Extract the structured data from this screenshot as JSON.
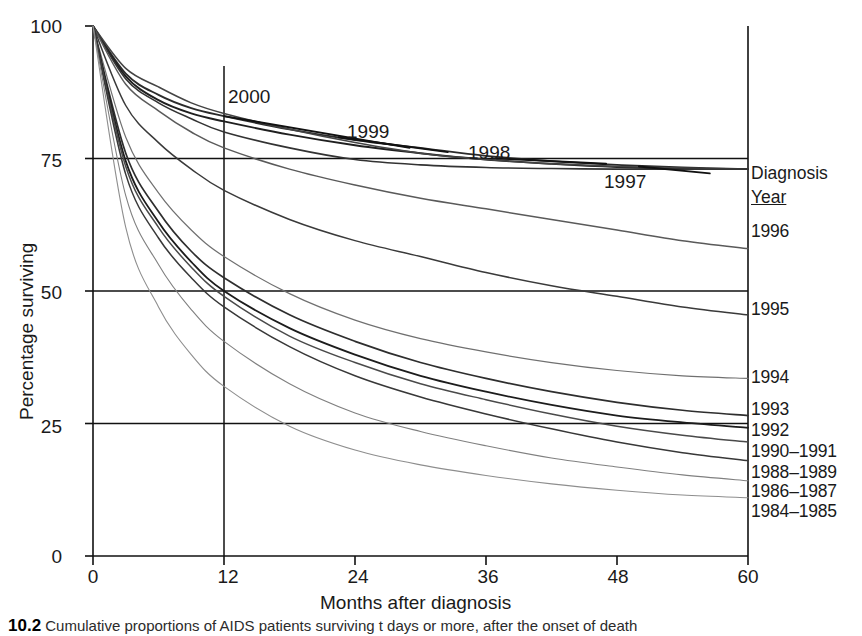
{
  "figure": {
    "caption_number": "10.2",
    "caption_text": "Cumulative proportions of AIDS patients surviving t days or more, after the onset of death"
  },
  "axes": {
    "y_title": "Percentage surviving",
    "x_title": "Months after diagnosis",
    "y_ticks": [
      "100",
      "75",
      "50",
      "25",
      "0"
    ],
    "x_ticks": [
      "0",
      "12",
      "24",
      "36",
      "48",
      "60"
    ]
  },
  "legend": {
    "title_line1": "Diagnosis",
    "title_line2": "Year",
    "entries": [
      {
        "label": "1996",
        "y": 232
      },
      {
        "label": "1995",
        "y": 310
      },
      {
        "label": "1994",
        "y": 378
      },
      {
        "label": "1993",
        "y": 410
      },
      {
        "label": "1992",
        "y": 431
      },
      {
        "label": "1990–1991",
        "y": 452
      },
      {
        "label": "1988–1989",
        "y": 473
      },
      {
        "label": "1986–1987",
        "y": 492
      },
      {
        "label": "1984–1985",
        "y": 512
      }
    ]
  },
  "inline_labels": [
    {
      "label": "2000",
      "x": 228,
      "y": 86
    },
    {
      "label": "1999",
      "x": 347,
      "y": 121
    },
    {
      "label": "1998",
      "x": 468,
      "y": 142
    },
    {
      "label": "1997",
      "x": 604,
      "y": 171
    }
  ],
  "chart_data": {
    "type": "line",
    "title": "",
    "xlabel": "Months after diagnosis",
    "ylabel": "Percentage surviving",
    "xlim": [
      0,
      60
    ],
    "ylim": [
      0,
      100
    ],
    "x_ticks": [
      0,
      12,
      24,
      36,
      48,
      60
    ],
    "y_ticks": [
      0,
      25,
      50,
      75,
      100
    ],
    "grid": "reference lines at y = 25, 50, 75 and x = 12",
    "legend_position": "right",
    "x": [
      0,
      3,
      6,
      9,
      12,
      18,
      24,
      30,
      36,
      42,
      48,
      54,
      60
    ],
    "series": [
      {
        "name": "2000",
        "label_position": "inline",
        "values": [
          100,
          91,
          87,
          84.5,
          83,
          80.5,
          78.5,
          77,
          75.5,
          74.5,
          73.8,
          73.3,
          73.0
        ]
      },
      {
        "name": "1999",
        "label_position": "inline",
        "values": [
          100,
          90.5,
          86,
          83.5,
          82,
          79.5,
          77.5,
          76,
          74.8,
          74.0,
          73.4,
          73.1,
          73.0
        ]
      },
      {
        "name": "1998",
        "label_position": "inline",
        "values": [
          100,
          92,
          88.5,
          85.5,
          83.5,
          80.5,
          78,
          76,
          74.8,
          74.0,
          73.5,
          73.2,
          73.0
        ]
      },
      {
        "name": "1997",
        "label_position": "inline",
        "values": [
          100,
          90,
          85.5,
          82.5,
          80,
          77,
          74.8,
          73.8,
          73.3,
          73.1,
          73.0,
          73.0,
          73.0
        ]
      },
      {
        "name": "1996",
        "label_position": "legend",
        "values": [
          100,
          89,
          84,
          80,
          77,
          73,
          70,
          67.5,
          65.5,
          63.5,
          61.5,
          59.5,
          58.0
        ]
      },
      {
        "name": "1995",
        "label_position": "legend",
        "values": [
          100,
          85,
          78,
          73,
          69,
          63.5,
          59.5,
          56.5,
          53.5,
          51,
          49,
          47,
          45.5
        ]
      },
      {
        "name": "1994",
        "label_position": "legend",
        "values": [
          100,
          79,
          68.5,
          61.5,
          56.5,
          49.5,
          44.5,
          41,
          38.5,
          36.5,
          35,
          34,
          33.5
        ]
      },
      {
        "name": "1993",
        "label_position": "legend",
        "values": [
          100,
          76,
          65,
          57.5,
          52.5,
          45.5,
          40.5,
          36.5,
          33.5,
          31,
          29,
          27.5,
          26.5
        ]
      },
      {
        "name": "1992",
        "label_position": "legend",
        "values": [
          100,
          74.5,
          63,
          55.5,
          50,
          43,
          38,
          34,
          31,
          28.5,
          26.5,
          25.2,
          24.2
        ]
      },
      {
        "name": "1990–1991",
        "label_position": "legend",
        "values": [
          100,
          73.5,
          62,
          54.5,
          49,
          41.5,
          36.5,
          32.5,
          29.5,
          26.8,
          24.5,
          22.8,
          21.5
        ]
      },
      {
        "name": "1988–1989",
        "label_position": "legend",
        "values": [
          100,
          72,
          60,
          52.5,
          47,
          39.5,
          34,
          30,
          26.8,
          24,
          21.5,
          19.5,
          18.0
        ]
      },
      {
        "name": "1986–1987",
        "label_position": "legend",
        "values": [
          100,
          68,
          55,
          46.5,
          40.5,
          32.5,
          27,
          23.5,
          20.8,
          18.5,
          16.8,
          15.3,
          14.2
        ]
      },
      {
        "name": "1984–1985",
        "label_position": "legend",
        "values": [
          100,
          62,
          47,
          38,
          32,
          24.5,
          20,
          17.2,
          15.2,
          13.6,
          12.4,
          11.5,
          11.0
        ]
      }
    ]
  }
}
